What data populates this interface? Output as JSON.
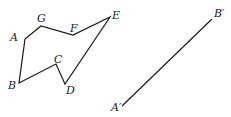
{
  "figure": {
    "polygon": {
      "vertices": [
        {
          "name": "A",
          "x": 25,
          "y": 39,
          "lx": 10,
          "ly": 41
        },
        {
          "name": "G",
          "x": 41,
          "y": 26,
          "lx": 37,
          "ly": 22
        },
        {
          "name": "F",
          "x": 73,
          "y": 35,
          "lx": 70,
          "ly": 32
        },
        {
          "name": "E",
          "x": 110,
          "y": 17,
          "lx": 112,
          "ly": 19
        },
        {
          "name": "D",
          "x": 65,
          "y": 84,
          "lx": 66,
          "ly": 94
        },
        {
          "name": "C",
          "x": 56,
          "y": 64,
          "lx": 54,
          "ly": 63
        },
        {
          "name": "B",
          "x": 19,
          "y": 83,
          "lx": 8,
          "ly": 89
        }
      ]
    },
    "segment": {
      "start": {
        "name": "A′",
        "x": 122,
        "y": 106,
        "lx": 111,
        "ly": 111
      },
      "end": {
        "name": "B′",
        "x": 212,
        "y": 19,
        "lx": 214,
        "ly": 17
      }
    },
    "stroke_color": "#1a1a1a"
  }
}
